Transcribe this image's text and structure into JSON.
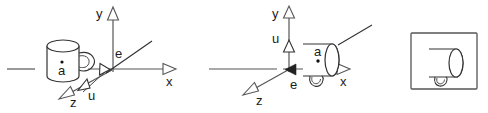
{
  "figure": {
    "panel_count": 3,
    "background_color": "#ffffff",
    "stroke_color": "#333333",
    "axis_color": "#555555",
    "label_color": "#1a1a1a"
  },
  "panels": [
    {
      "id": "left",
      "name": "before-rotation",
      "axes": [
        {
          "name": "y",
          "label": "y",
          "direction": "up"
        },
        {
          "name": "x",
          "label": "x",
          "direction": "right"
        },
        {
          "name": "z",
          "label": "z",
          "direction": "down-left"
        }
      ],
      "vectors": [
        {
          "name": "e",
          "label": "e",
          "direction": "up-right",
          "style": "plain-ray"
        },
        {
          "name": "u",
          "label": "u",
          "direction": "down-left",
          "style": "hollow-arrow"
        }
      ],
      "object": {
        "name": "mug",
        "orientation": "upright",
        "handle_side": "right",
        "point_label": "a",
        "point_marker": "dot"
      }
    },
    {
      "id": "middle",
      "name": "after-rotation",
      "axes": [
        {
          "name": "y",
          "label": "y",
          "direction": "up"
        },
        {
          "name": "x",
          "label": "x",
          "direction": "right"
        },
        {
          "name": "z",
          "label": "z",
          "direction": "down-left"
        }
      ],
      "vectors": [
        {
          "name": "u",
          "label": "u",
          "direction": "up",
          "style": "hollow-arrow"
        },
        {
          "name": "e",
          "label": "e",
          "direction": "left",
          "style": "solid-arrow"
        }
      ],
      "object": {
        "name": "mug",
        "orientation": "rotated-on-side",
        "handle_side": "bottom",
        "point_label": "a",
        "point_marker": "dot"
      }
    },
    {
      "id": "right",
      "name": "result-framed-view",
      "frame": true,
      "object": {
        "name": "mug",
        "orientation": "rotated-on-side",
        "handle_side": "bottom",
        "point_label": "",
        "point_marker": "none"
      }
    }
  ],
  "labels": {
    "x": "x",
    "y": "y",
    "z": "z",
    "e": "e",
    "u": "u",
    "a": "a"
  }
}
